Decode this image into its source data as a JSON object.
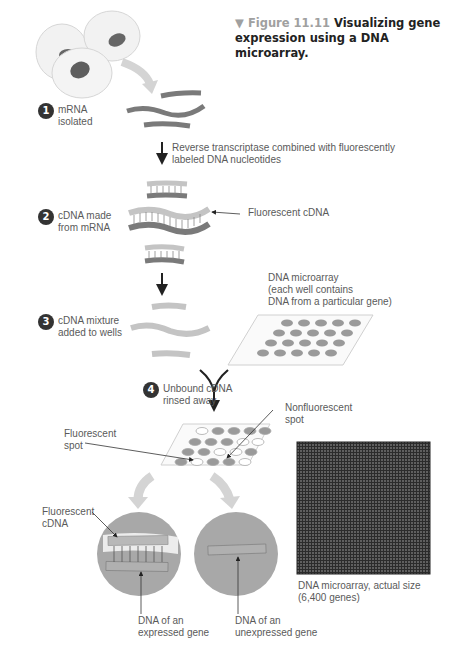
{
  "figure": {
    "marker": "▼",
    "number_label": "Figure 11.11",
    "title_line1": "Visualizing gene",
    "title_line2": "expression using a DNA microarray."
  },
  "steps": [
    {
      "number": "1",
      "line1": "mRNA",
      "line2": "isolated"
    },
    {
      "number": "2",
      "line1": "cDNA made",
      "line2": "from mRNA"
    },
    {
      "number": "3",
      "line1": "cDNA mixture",
      "line2": "added to wells"
    },
    {
      "number": "4",
      "line1": "Unbound cDNA",
      "line2": "rinsed away"
    }
  ],
  "annotations": {
    "reverse_transcriptase_line1": "Reverse transcriptase combined with fluorescently",
    "reverse_transcriptase_line2": "labeled DNA nucleotides",
    "fluorescent_cdna_callout": "Fluorescent cDNA",
    "microarray_line1": "DNA microarray",
    "microarray_line2": "(each well contains",
    "microarray_line3": "DNA from a particular gene)",
    "nonfluorescent_line1": "Nonfluorescent",
    "nonfluorescent_line2": "spot",
    "fluorescent_spot_line1": "Fluorescent",
    "fluorescent_spot_line2": "spot",
    "fluorescent_cdna_line1": "Fluorescent",
    "fluorescent_cdna_line2": "cDNA",
    "expressed_line1": "DNA of an",
    "expressed_line2": "expressed gene",
    "unexpressed_line1": "DNA of an",
    "unexpressed_line2": "unexpressed gene",
    "actual_size_line1": "DNA microarray, actual size",
    "actual_size_line2": "(6,400 genes)"
  },
  "colors": {
    "mrna_strand": "#7a7a7a",
    "cdna_strand": "#c4c4c4",
    "well_spot": "#9a9a9a",
    "cell_fill": "#f2f2f2",
    "nucleus": "#666666",
    "zoom_circle": "#a8a8a8",
    "photo_bg": "#2a2a2a"
  }
}
